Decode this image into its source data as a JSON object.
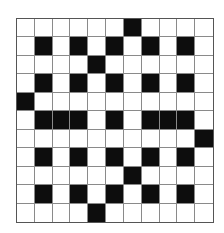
{
  "puzzle": {
    "type": "crossword-grid",
    "rows": 11,
    "cols": 11,
    "black_cells": [
      [
        0,
        6
      ],
      [
        1,
        1
      ],
      [
        1,
        3
      ],
      [
        1,
        5
      ],
      [
        1,
        7
      ],
      [
        1,
        9
      ],
      [
        2,
        4
      ],
      [
        3,
        1
      ],
      [
        3,
        3
      ],
      [
        3,
        5
      ],
      [
        3,
        7
      ],
      [
        3,
        9
      ],
      [
        4,
        0
      ],
      [
        5,
        1
      ],
      [
        5,
        2
      ],
      [
        5,
        3
      ],
      [
        5,
        5
      ],
      [
        5,
        7
      ],
      [
        5,
        8
      ],
      [
        5,
        9
      ],
      [
        6,
        10
      ],
      [
        7,
        1
      ],
      [
        7,
        3
      ],
      [
        7,
        5
      ],
      [
        7,
        7
      ],
      [
        7,
        9
      ],
      [
        8,
        6
      ],
      [
        9,
        1
      ],
      [
        9,
        3
      ],
      [
        9,
        5
      ],
      [
        9,
        7
      ],
      [
        9,
        9
      ],
      [
        10,
        4
      ]
    ],
    "colors": {
      "black": "#0d0d0d",
      "white": "#ffffff",
      "gridline": "#8a8a8a"
    }
  }
}
